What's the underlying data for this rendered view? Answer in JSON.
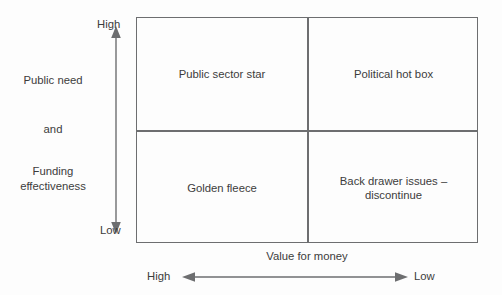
{
  "diagram": {
    "type": "2x2-matrix",
    "line_color": "#6d6e70",
    "text_color": "#3c3c3c",
    "background_color": "#fdfdfd",
    "vertical_axis": {
      "label_lines": [
        "Public need",
        "and",
        "Funding effectiveness"
      ],
      "label_line_1": "Public need",
      "label_line_2": "and",
      "label_line_3a": "Funding",
      "label_line_3b": "effectiveness",
      "top_cap": "High",
      "bottom_cap": "Low",
      "direction": "double-headed-vertical"
    },
    "horizontal_axis": {
      "title": "Value for money",
      "left_cap": "High",
      "right_cap": "Low",
      "direction": "double-headed-horizontal"
    },
    "quadrants": [
      {
        "id": "top-left",
        "label": "Public sector star",
        "lines": [
          "Public sector star"
        ],
        "public_need": "High",
        "value_for_money": "High"
      },
      {
        "id": "top-right",
        "label": "Political hot box",
        "lines": [
          "Political hot box"
        ],
        "public_need": "High",
        "value_for_money": "Low"
      },
      {
        "id": "bottom-left",
        "label": "Golden fleece",
        "lines": [
          "Golden fleece"
        ],
        "public_need": "Low",
        "value_for_money": "High"
      },
      {
        "id": "bottom-right",
        "label": "Back drawer issues – discontinue",
        "lines": [
          "Back drawer issues –",
          "discontinue"
        ],
        "line_1": "Back drawer issues –",
        "line_2": "discontinue",
        "public_need": "Low",
        "value_for_money": "Low"
      }
    ]
  }
}
